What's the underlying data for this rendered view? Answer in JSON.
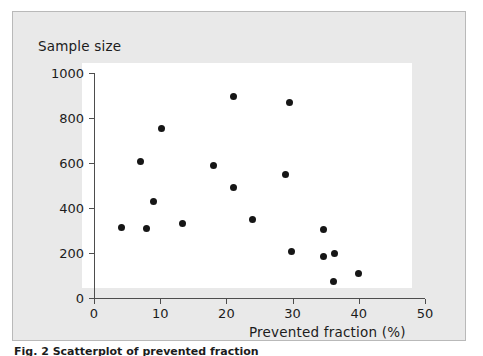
{
  "figure": {
    "background_color": "#e9e9e9",
    "plot_background_color": "#ffffff",
    "border_color": "#b9b9b9",
    "axis_color": "#4d4d4d",
    "point_color": "#161616"
  },
  "chart_data": {
    "type": "scatter",
    "title": "",
    "xlabel": "Prevented fraction (%)",
    "ylabel": "Sample size",
    "xlim": [
      0,
      50
    ],
    "ylim": [
      0,
      1000
    ],
    "xticks": [
      "0",
      "10",
      "20",
      "30",
      "40",
      "50"
    ],
    "xtick_values": [
      0,
      10,
      20,
      30,
      40,
      50
    ],
    "yticks": [
      "0",
      "200",
      "400",
      "600",
      "800",
      "1000"
    ],
    "ytick_values": [
      0,
      200,
      400,
      600,
      800,
      1000
    ],
    "grid": false,
    "legend": null,
    "marker": "filled-circle",
    "points": [
      {
        "x": 4.2,
        "y": 315
      },
      {
        "x": 7.0,
        "y": 605
      },
      {
        "x": 8.0,
        "y": 310
      },
      {
        "x": 9.0,
        "y": 430
      },
      {
        "x": 10.2,
        "y": 755
      },
      {
        "x": 13.3,
        "y": 330
      },
      {
        "x": 18.0,
        "y": 588
      },
      {
        "x": 21.0,
        "y": 895
      },
      {
        "x": 21.0,
        "y": 490
      },
      {
        "x": 24.0,
        "y": 348
      },
      {
        "x": 29.0,
        "y": 550
      },
      {
        "x": 29.5,
        "y": 870
      },
      {
        "x": 29.8,
        "y": 205
      },
      {
        "x": 34.7,
        "y": 303
      },
      {
        "x": 34.6,
        "y": 183
      },
      {
        "x": 36.4,
        "y": 200
      },
      {
        "x": 36.2,
        "y": 72
      },
      {
        "x": 40.0,
        "y": 110
      }
    ]
  },
  "caption": {
    "text": "Fig. 2 Scatterplot of prevented fraction"
  }
}
